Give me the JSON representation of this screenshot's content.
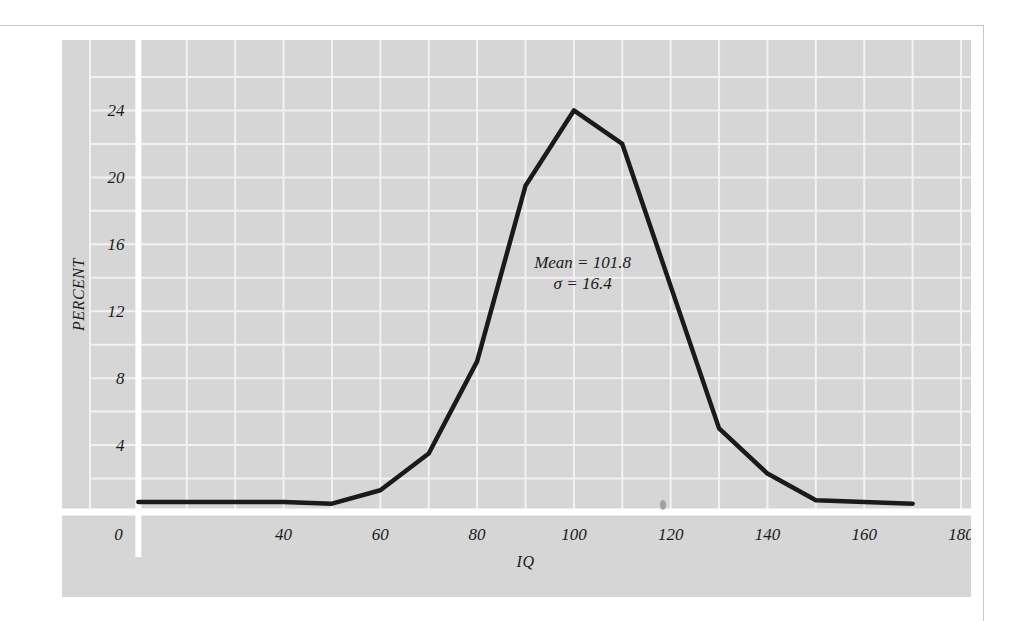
{
  "figure": {
    "panel_color": "#d6d6d6",
    "grid_color": "#f2f2f2",
    "axis_color": "#ffffff",
    "line_color": "#1a1a1a",
    "page_rule_color": "#c9c9c9"
  },
  "annotation": {
    "mean_line": "Mean = 101.8",
    "sigma_line": "σ = 16.4"
  },
  "chart_data": {
    "type": "line",
    "title": "",
    "xlabel": "IQ",
    "ylabel": "PERCENT",
    "xlim": [
      0,
      180
    ],
    "ylim": [
      0,
      26
    ],
    "grid": true,
    "grid_x_step": 10,
    "grid_y_step": 2,
    "legend": "none",
    "xticks": [
      0,
      40,
      60,
      80,
      100,
      120,
      140,
      160,
      180
    ],
    "xtick_labels": [
      "0",
      "40",
      "60",
      "80",
      "100",
      "120",
      "140",
      "160",
      "180"
    ],
    "yticks": [
      4,
      8,
      12,
      16,
      20,
      24
    ],
    "ytick_labels": [
      "4",
      "8",
      "12",
      "16",
      "20",
      "24"
    ],
    "x": [
      10,
      20,
      30,
      40,
      50,
      60,
      70,
      80,
      90,
      100,
      110,
      120,
      130,
      140,
      150,
      160,
      170
    ],
    "values": [
      0.6,
      0.6,
      0.6,
      0.6,
      0.5,
      1.3,
      3.5,
      9.0,
      19.5,
      24.0,
      22.0,
      13.5,
      5.0,
      2.3,
      0.7,
      0.6,
      0.5
    ],
    "series": [
      {
        "name": "IQ distribution",
        "values": [
          0.6,
          0.6,
          0.6,
          0.6,
          0.5,
          1.3,
          3.5,
          9.0,
          19.5,
          24.0,
          22.0,
          13.5,
          5.0,
          2.3,
          0.7,
          0.6,
          0.5
        ]
      }
    ],
    "annotations": [
      {
        "text": "Mean = 101.8",
        "x": 101.8,
        "y": 14.6
      },
      {
        "text": "σ = 16.4",
        "x": 101.8,
        "y": 13.3
      }
    ]
  }
}
